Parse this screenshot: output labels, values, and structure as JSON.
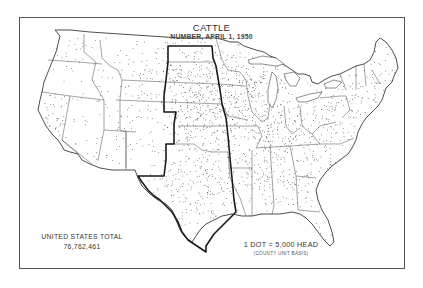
{
  "map": {
    "title": "CATTLE",
    "subtitle": "NUMBER, APRIL 1, 1950",
    "total_label": "UNITED STATES TOTAL",
    "total_value": "76,762,461",
    "legend": {
      "scale": "1 DOT = 5,000 HEAD",
      "basis": "(COUNTY UNIT BASIS)"
    },
    "highlighted_region": "Great Plains states (ND, SD, NE, KS, OK, TX, plus eastern CO)",
    "colors": {
      "background": "#ffffff",
      "ink": "#2a2a2a",
      "frame": "#555555",
      "region_outline": "#1a1a1a"
    }
  },
  "chart_data": {
    "type": "dot-density-map",
    "title": "CATTLE",
    "subtitle": "NUMBER, APRIL 1, 1950",
    "unit": "1 dot = 5,000 head (county unit basis)",
    "total": 76762461,
    "density_regions": [
      {
        "region": "Upper Midwest (MN, WI, IA, IL)",
        "density": "very high"
      },
      {
        "region": "Great Plains (ND, SD, NE, KS, OK, TX)",
        "density": "high"
      },
      {
        "region": "Corn Belt / Ohio Valley",
        "density": "high"
      },
      {
        "region": "Southeast",
        "density": "medium"
      },
      {
        "region": "Northeast / New England",
        "density": "medium-low"
      },
      {
        "region": "Mountain West",
        "density": "low"
      },
      {
        "region": "Pacific coast",
        "density": "low, clustered in valleys"
      }
    ]
  }
}
